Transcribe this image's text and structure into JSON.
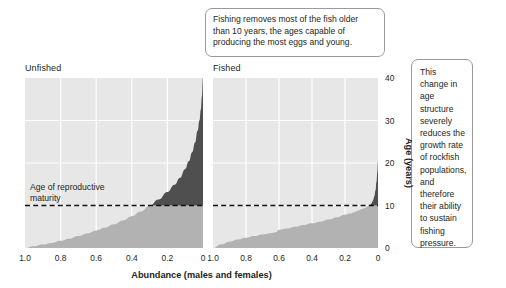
{
  "figure": {
    "panels": [
      {
        "key": "unfished",
        "label": "Unfished"
      },
      {
        "key": "fished",
        "label": "Fished"
      }
    ],
    "callouts": {
      "top": "Fishing removes most of the fish older than 10 years, the ages capable of producing the most eggs and young.",
      "right": "This change in age structure severely reduces the growth rate of rockfish populations, and therefore their ability to sustain fishing pressure."
    },
    "maturity_label_line1": "Age of reproductive",
    "maturity_label_line2": "maturity",
    "colors": {
      "plot_background": "#e7e7e7",
      "gridline": "#ffffff",
      "fill_above_maturity": "#4f4f4f",
      "fill_below_maturity": "#b2b2b2",
      "maturity_line": "#111111",
      "text": "#231f20",
      "callout_border": "#9a9a9a"
    }
  },
  "chart_data": [
    {
      "type": "area",
      "panel": "unfished",
      "title": "Unfished",
      "xlabel": "Abundance (males and females)",
      "ylabel": "Age (years)",
      "xlim": [
        1.0,
        0.0
      ],
      "ylim": [
        0,
        40
      ],
      "xticks": [
        "1.0",
        "0.8",
        "0.6",
        "0.4",
        "0.2",
        "0"
      ],
      "xtick_values": [
        1.0,
        0.8,
        0.6,
        0.4,
        0.2,
        0.0
      ],
      "yticks": [
        "0",
        "10",
        "20",
        "30",
        "40"
      ],
      "ytick_values": [
        0,
        10,
        20,
        30,
        40
      ],
      "grid": true,
      "maturity_age": 10,
      "x": [
        1.0,
        0.95,
        0.9,
        0.85,
        0.8,
        0.75,
        0.7,
        0.65,
        0.6,
        0.55,
        0.5,
        0.45,
        0.4,
        0.35,
        0.3,
        0.25,
        0.2,
        0.16,
        0.13,
        0.1,
        0.08,
        0.06,
        0.045,
        0.03,
        0.02,
        0.012,
        0.006,
        0.0
      ],
      "y": [
        0.0,
        0.4,
        0.8,
        1.2,
        1.7,
        2.2,
        2.8,
        3.4,
        4.1,
        4.8,
        5.6,
        6.5,
        7.5,
        8.6,
        9.9,
        11.4,
        13.2,
        14.9,
        16.5,
        18.6,
        20.4,
        22.6,
        24.8,
        27.6,
        30.0,
        32.6,
        35.6,
        40.0
      ]
    },
    {
      "type": "area",
      "panel": "fished",
      "title": "Fished",
      "xlabel": "Abundance (males and females)",
      "ylabel": "Age (years)",
      "xlim": [
        1.0,
        0.0
      ],
      "ylim": [
        0,
        40
      ],
      "xticks": [
        "1.0",
        "0.8",
        "0.6",
        "0.4",
        "0.2",
        "0"
      ],
      "xtick_values": [
        1.0,
        0.8,
        0.6,
        0.4,
        0.2,
        0.0
      ],
      "yticks": [
        "0",
        "10",
        "20",
        "30",
        "40"
      ],
      "ytick_values": [
        0,
        10,
        20,
        30,
        40
      ],
      "grid": true,
      "maturity_age": 10,
      "x": [
        1.0,
        0.95,
        0.9,
        0.85,
        0.8,
        0.75,
        0.7,
        0.65,
        0.62,
        0.6,
        0.55,
        0.5,
        0.45,
        0.4,
        0.35,
        0.3,
        0.25,
        0.2,
        0.17,
        0.14,
        0.12,
        0.1,
        0.08,
        0.06,
        0.05,
        0.04,
        0.03,
        0.022,
        0.015,
        0.009,
        0.004,
        0.0
      ],
      "y": [
        0.0,
        0.9,
        1.5,
        2.0,
        2.4,
        2.8,
        3.2,
        3.5,
        3.7,
        4.3,
        4.6,
        5.0,
        5.4,
        5.8,
        6.2,
        6.7,
        7.2,
        7.8,
        8.1,
        8.5,
        8.8,
        9.1,
        9.4,
        9.8,
        10.1,
        10.5,
        11.2,
        12.2,
        13.6,
        15.6,
        17.8,
        20.4
      ]
    }
  ]
}
